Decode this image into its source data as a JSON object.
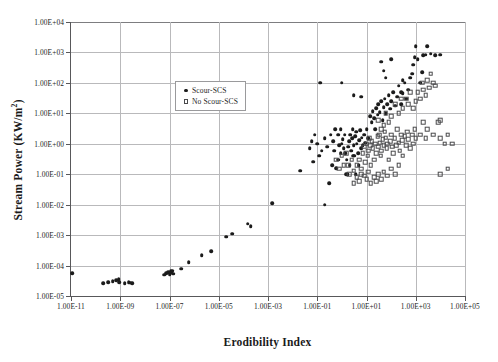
{
  "chart_data": {
    "type": "scatter",
    "title": "",
    "xlabel": "Erodibility Index",
    "ylabel": "Stream Power (KW/m2)",
    "ylabel_html": "Stream Power (KW/m<sup>2</sup>)",
    "xscale": "log",
    "yscale": "log",
    "xlim": [
      1e-11,
      100000.0
    ],
    "ylim": [
      1e-05,
      10000.0
    ],
    "grid": true,
    "legend_position": "upper-left-inside",
    "xticks": [
      "1.00E-11",
      "1.00E-09",
      "1.00E-07",
      "1.00E-05",
      "1.00E-03",
      "1.00E-01",
      "1.00E+01",
      "1.00E+03",
      "1.00E+05"
    ],
    "xtick_values": [
      1e-11,
      1e-09,
      1e-07,
      1e-05,
      0.001,
      0.1,
      10.0,
      1000.0,
      100000.0
    ],
    "yticks": [
      "1.00E+04",
      "1.00E+03",
      "1.00E+02",
      "1.00E+01",
      "1.00E+00",
      "1.00E-01",
      "1.00E-02",
      "1.00E-03",
      "1.00E-04",
      "1.00E-05"
    ],
    "ytick_values": [
      10000.0,
      1000.0,
      100.0,
      10.0,
      1.0,
      0.1,
      0.01,
      0.001,
      0.0001,
      1e-05
    ],
    "marker_colors": {
      "scour": "#1b1b1b",
      "no_scour": "#4a4a4c"
    },
    "grid_color": "#b9b9bb",
    "axis_color": "#58585a",
    "series": [
      {
        "name": "Scour-SCS",
        "marker": "filled-circle",
        "points": [
          [
            1.1e-11,
            5.5e-05
          ],
          [
            2e-10,
            2.6e-05
          ],
          [
            3.2e-10,
            2.8e-05
          ],
          [
            5e-10,
            3e-05
          ],
          [
            7e-10,
            3.3e-05
          ],
          [
            8.5e-10,
            3.6e-05
          ],
          [
            9e-10,
            2.9e-05
          ],
          [
            1.5e-09,
            2.6e-05
          ],
          [
            2.2e-09,
            2.8e-05
          ],
          [
            2.6e-09,
            2.7e-05
          ],
          [
            3e-09,
            2.6e-05
          ],
          [
            6e-08,
            5e-05
          ],
          [
            7.5e-08,
            5.6e-05
          ],
          [
            9e-08,
            6e-05
          ],
          [
            1e-07,
            5.2e-05
          ],
          [
            1.1e-07,
            6.4e-05
          ],
          [
            1.2e-07,
            5.8e-05
          ],
          [
            1.3e-07,
            6.8e-05
          ],
          [
            1.4e-07,
            5.4e-05
          ],
          [
            3e-07,
            8e-05
          ],
          [
            6e-07,
            0.00013
          ],
          [
            2e-06,
            0.00022
          ],
          [
            5e-06,
            0.0003
          ],
          [
            2e-05,
            0.0009
          ],
          [
            3.5e-05,
            0.0011
          ],
          [
            0.00015,
            0.0024
          ],
          [
            0.0002,
            0.002
          ],
          [
            0.0015,
            0.011
          ],
          [
            0.02,
            0.13
          ],
          [
            0.07,
            0.26
          ],
          [
            0.12,
            0.4
          ],
          [
            0.2,
            0.01
          ],
          [
            0.3,
            0.05
          ],
          [
            0.4,
            0.2
          ],
          [
            0.5,
            0.6
          ],
          [
            0.6,
            0.16
          ],
          [
            0.7,
            0.3
          ],
          [
            0.8,
            0.9
          ],
          [
            0.9,
            0.5
          ],
          [
            1.0,
            1.0
          ],
          [
            1.1,
            1.4
          ],
          [
            1.2,
            0.7
          ],
          [
            1.3,
            2.0
          ],
          [
            1.5,
            0.1
          ],
          [
            1.6,
            0.3
          ],
          [
            1.8,
            0.8
          ],
          [
            2.0,
            1.2
          ],
          [
            2.2,
            2.0
          ],
          [
            2.4,
            0.6
          ],
          [
            2.6,
            1.5
          ],
          [
            2.8,
            3.0
          ],
          [
            3.0,
            0.9
          ],
          [
            3.2,
            0.4
          ],
          [
            3.5,
            1.8
          ],
          [
            3.8,
            2.5
          ],
          [
            4.0,
            1.0
          ],
          [
            4.5,
            0.5
          ],
          [
            5.0,
            1.3
          ],
          [
            5.5,
            2.8
          ],
          [
            6.0,
            0.7
          ],
          [
            6.5,
            1.6
          ],
          [
            7.0,
            0.9
          ],
          [
            8.0,
            2.0
          ],
          [
            9.0,
            1.1
          ],
          [
            10.0,
            3.0
          ],
          [
            12.0,
            1.5
          ],
          [
            14.0,
            8.0
          ],
          [
            16.0,
            5.0
          ],
          [
            18.0,
            12.0
          ],
          [
            20.0,
            7.0
          ],
          [
            22.0,
            3.0
          ],
          [
            25.0,
            15.0
          ],
          [
            28.0,
            9.0
          ],
          [
            30.0,
            20.0
          ],
          [
            35.0,
            11.0
          ],
          [
            40.0,
            25.0
          ],
          [
            45.0,
            6.0
          ],
          [
            50.0,
            16.0
          ],
          [
            55.0,
            30.0
          ],
          [
            60.0,
            10.0
          ],
          [
            70.0,
            20.0
          ],
          [
            80.0,
            40.0
          ],
          [
            90.0,
            14.0
          ],
          [
            100.0,
            25.0
          ],
          [
            120.0,
            50.0
          ],
          [
            150.0,
            18.0
          ],
          [
            180.0,
            35.0
          ],
          [
            200.0,
            80.0
          ],
          [
            250.0,
            20.0
          ],
          [
            300.0,
            45.0
          ],
          [
            350.0,
            100.0
          ],
          [
            400.0,
            30.0
          ],
          [
            500.0,
            60.0
          ],
          [
            600.0,
            150.0
          ],
          [
            700.0,
            200.0
          ],
          [
            800.0,
            400.0
          ],
          [
            900.0,
            700.0
          ],
          [
            1000.0,
            1600.0
          ],
          [
            1200.0,
            600.0
          ],
          [
            1500.0,
            100.0
          ],
          [
            1800.0,
            220.0
          ],
          [
            2000.0,
            800.0
          ],
          [
            2500.0,
            850.0
          ],
          [
            3000.0,
            1600.0
          ],
          [
            4000.0,
            900.0
          ],
          [
            6000.0,
            800.0
          ],
          [
            10000.0,
            850.0
          ],
          [
            0.13,
            100.0
          ],
          [
            1.0,
            100.0
          ],
          [
            3.0,
            40.0
          ],
          [
            6.0,
            35.0
          ],
          [
            40.0,
            500.0
          ],
          [
            50.0,
            250.0
          ],
          [
            60.0,
            150.0
          ],
          [
            100.0,
            600.0
          ],
          [
            250.0,
            50.0
          ],
          [
            300.0,
            120.0
          ],
          [
            0.7,
            2.0
          ],
          [
            0.9,
            3.0
          ],
          [
            1.4,
            0.5
          ],
          [
            1.7,
            0.1
          ],
          [
            2.1,
            0.2
          ],
          [
            2.9,
            0.4
          ],
          [
            3.6,
            0.1
          ],
          [
            4.8,
            0.2
          ],
          [
            0.2,
            1.5
          ],
          [
            0.25,
            0.8
          ],
          [
            0.35,
            2.0
          ],
          [
            0.45,
            1.2
          ],
          [
            0.55,
            3.0
          ],
          [
            0.08,
            2.0
          ],
          [
            0.1,
            1.0
          ],
          [
            0.15,
            0.6
          ],
          [
            0.06,
            1.2
          ],
          [
            0.05,
            0.7
          ]
        ]
      },
      {
        "name": "No Scour-SCS",
        "marker": "open-square",
        "points": [
          [
            2.0,
            0.1
          ],
          [
            3.0,
            0.13
          ],
          [
            4.0,
            0.2
          ],
          [
            5.0,
            0.3
          ],
          [
            6.0,
            0.15
          ],
          [
            7.0,
            0.5
          ],
          [
            8.0,
            0.8
          ],
          [
            9.0,
            0.25
          ],
          [
            10.0,
            1.0
          ],
          [
            11.0,
            0.4
          ],
          [
            12.0,
            0.6
          ],
          [
            13.0,
            1.5
          ],
          [
            14.0,
            0.9
          ],
          [
            15.0,
            0.2
          ],
          [
            16.0,
            1.2
          ],
          [
            18.0,
            0.7
          ],
          [
            20.0,
            0.3
          ],
          [
            22.0,
            1.0
          ],
          [
            25.0,
            0.5
          ],
          [
            28.0,
            1.8
          ],
          [
            30.0,
            0.8
          ],
          [
            32.0,
            2.0
          ],
          [
            35.0,
            1.1
          ],
          [
            38.0,
            0.4
          ],
          [
            40.0,
            0.6
          ],
          [
            45.0,
            1.4
          ],
          [
            50.0,
            0.9
          ],
          [
            55.0,
            2.5
          ],
          [
            60.0,
            1.6
          ],
          [
            65.0,
            0.7
          ],
          [
            70.0,
            1.0
          ],
          [
            80.0,
            0.3
          ],
          [
            90.0,
            1.2
          ],
          [
            100.0,
            2.0
          ],
          [
            110.0,
            0.8
          ],
          [
            120.0,
            0.5
          ],
          [
            140.0,
            1.5
          ],
          [
            160.0,
            0.9
          ],
          [
            180.0,
            3.0
          ],
          [
            200.0,
            1.1
          ],
          [
            220.0,
            0.6
          ],
          [
            250.0,
            2.0
          ],
          [
            280.0,
            1.3
          ],
          [
            300.0,
            0.4
          ],
          [
            350.0,
            1.8
          ],
          [
            400.0,
            0.9
          ],
          [
            450.0,
            2.5
          ],
          [
            500.0,
            1.4
          ],
          [
            600.0,
            0.7
          ],
          [
            700.0,
            2.0
          ],
          [
            800.0,
            1.0
          ],
          [
            900.0,
            3.0
          ],
          [
            1000.0,
            1.5
          ],
          [
            1200.0,
            50.0
          ],
          [
            1500.0,
            30.0
          ],
          [
            1800.0,
            100.0
          ],
          [
            2000.0,
            60.0
          ],
          [
            2500.0,
            40.0
          ],
          [
            3000.0,
            120.0
          ],
          [
            3500.0,
            70.0
          ],
          [
            4000.0,
            200.0
          ],
          [
            5000.0,
            100.0
          ],
          [
            6000.0,
            80.0
          ],
          [
            8000.0,
            5.0
          ],
          [
            10000.0,
            6.0
          ],
          [
            15000.0,
            1.0
          ],
          [
            400.0,
            30.0
          ],
          [
            500.0,
            20.0
          ],
          [
            600.0,
            50.0
          ],
          [
            800.0,
            15.0
          ],
          [
            1000.0,
            25.0
          ],
          [
            150.0,
            20.0
          ],
          [
            200.0,
            10.0
          ],
          [
            250.0,
            30.0
          ],
          [
            300.0,
            15.0
          ],
          [
            60.0,
            10.0
          ],
          [
            80.0,
            5.0
          ],
          [
            100.0,
            8.0
          ],
          [
            30.0,
            6.0
          ],
          [
            40.0,
            3.0
          ],
          [
            50.0,
            4.0
          ],
          [
            15.0,
            0.05
          ],
          [
            20.0,
            0.08
          ],
          [
            25.0,
            0.06
          ],
          [
            30.0,
            0.1
          ],
          [
            40.0,
            0.07
          ],
          [
            50.0,
            0.12
          ],
          [
            70.0,
            0.09
          ],
          [
            100.0,
            0.15
          ],
          [
            150.0,
            0.1
          ],
          [
            200.0,
            0.2
          ],
          [
            5.0,
            0.06
          ],
          [
            8.0,
            0.09
          ],
          [
            10.0,
            0.07
          ],
          [
            12.0,
            0.12
          ],
          [
            3.0,
            0.05
          ],
          [
            4.0,
            0.08
          ],
          [
            6.0,
            0.1
          ],
          [
            2.5,
            0.3
          ],
          [
            1.5,
            0.5
          ],
          [
            1.8,
            0.2
          ],
          [
            1.0,
            0.4
          ],
          [
            1.2,
            0.2
          ],
          [
            0.8,
            0.15
          ],
          [
            0.6,
            0.3
          ],
          [
            2000.0,
            5.0
          ],
          [
            3000.0,
            3.0
          ],
          [
            5000.0,
            2.0
          ],
          [
            10000.0,
            1.5
          ],
          [
            20000.0,
            2.0
          ],
          [
            30000.0,
            1.0
          ],
          [
            10000.0,
            0.1
          ],
          [
            20000.0,
            0.15
          ],
          [
            1500.0,
            2.0
          ],
          [
            2500.0,
            1.5
          ]
        ]
      }
    ]
  },
  "legend": {
    "items": [
      {
        "label": "Scour-SCS",
        "marker": "filled-circle"
      },
      {
        "label": "No Scour-SCS",
        "marker": "open-square"
      }
    ]
  }
}
